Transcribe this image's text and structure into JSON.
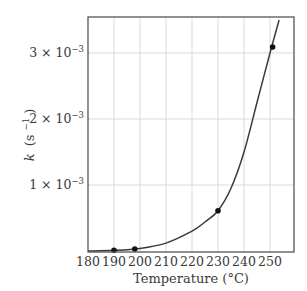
{
  "chart_data": {
    "type": "line",
    "title": "",
    "xlabel": "Temperature (°C)",
    "ylabel": "k (s⁻¹)",
    "ylabel_parts": {
      "var": "k",
      "unit_base": "(s",
      "unit_exp": "−1",
      "unit_close": ")"
    },
    "xlim": [
      180,
      259
    ],
    "ylim": [
      0,
      0.0037
    ],
    "grid": true,
    "legend": null,
    "x_ticks": [
      180,
      190,
      200,
      210,
      220,
      230,
      240,
      250
    ],
    "x_tick_labels": [
      "180",
      "190",
      "200",
      "210",
      "220",
      "230",
      "240",
      "250"
    ],
    "y_ticks": [
      0.001,
      0.002,
      0.003
    ],
    "y_tick_labels": [
      {
        "mantissa": "1 × 10",
        "exp": "−3"
      },
      {
        "mantissa": "2 × 10",
        "exp": "−3"
      },
      {
        "mantissa": "3 × 10",
        "exp": "−3"
      }
    ],
    "series": [
      {
        "name": "measured points",
        "kind": "scatter",
        "x": [
          190,
          198,
          230,
          251
        ],
        "y": [
          1e-05,
          3e-05,
          0.00061,
          0.00309
        ]
      },
      {
        "name": "fitted curve",
        "kind": "line",
        "x": [
          180,
          190,
          200,
          210,
          220,
          225,
          230,
          235,
          240,
          245,
          250,
          253.5
        ],
        "y": [
          0.0,
          1e-05,
          4e-05,
          0.00012,
          0.0003,
          0.00044,
          0.00061,
          0.00095,
          0.0015,
          0.00225,
          0.003,
          0.0035
        ]
      }
    ]
  },
  "style": {
    "frame_color": "#555555",
    "grid_color": "#d9d9d9",
    "curve_color": "#3a3a3a",
    "point_color": "#111111"
  }
}
